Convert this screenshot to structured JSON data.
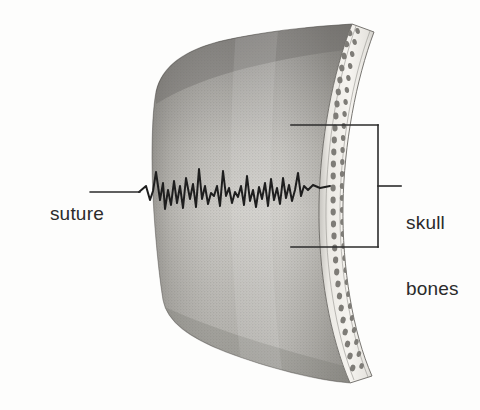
{
  "figure": {
    "background_color": "#fdfdfc",
    "ink_color": "#2b2b2b"
  },
  "labels": {
    "suture": {
      "text": "suture",
      "leader": "straight horizontal leader line pointing right to the jagged suture"
    },
    "skull_bones": {
      "line1": "skull",
      "line2": "bones",
      "bracket": "square bracket spanning the cut edge of the bone"
    }
  },
  "artwork": {
    "bone_panel_name": "skull-bone-panel",
    "cut_edge_name": "bone-cut-edge",
    "suture_line_name": "suture-jagged-line",
    "outer_table_color": "#f0eeea",
    "diploe_speckle_color": "#8a8882",
    "panel_shade_dark": "#8e8c88",
    "panel_shade_light": "#d9d7d2"
  }
}
